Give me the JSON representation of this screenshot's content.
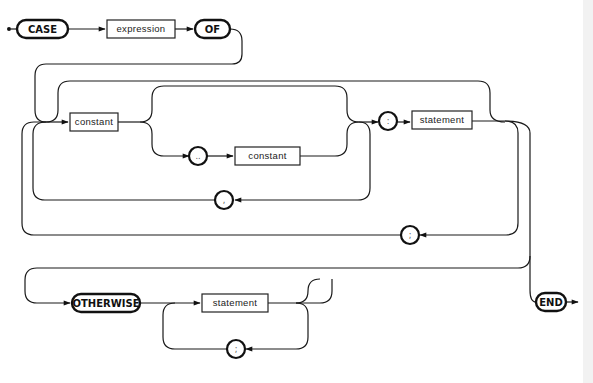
{
  "diagram": {
    "keywords": {
      "case": "CASE",
      "of": "OF",
      "otherwise": "OTHERWISE",
      "end": "END"
    },
    "nonterminals": {
      "expression": "expression",
      "constant_1": "constant",
      "constant_2": "constant",
      "statement_1": "statement",
      "statement_2": "statement"
    },
    "symbols": {
      "range": "..",
      "comma": ",",
      "colon": ":",
      "semicolon_1": ";",
      "semicolon_2": ";"
    },
    "colors": {
      "ink": "#111111",
      "background": "#ffffff"
    }
  }
}
